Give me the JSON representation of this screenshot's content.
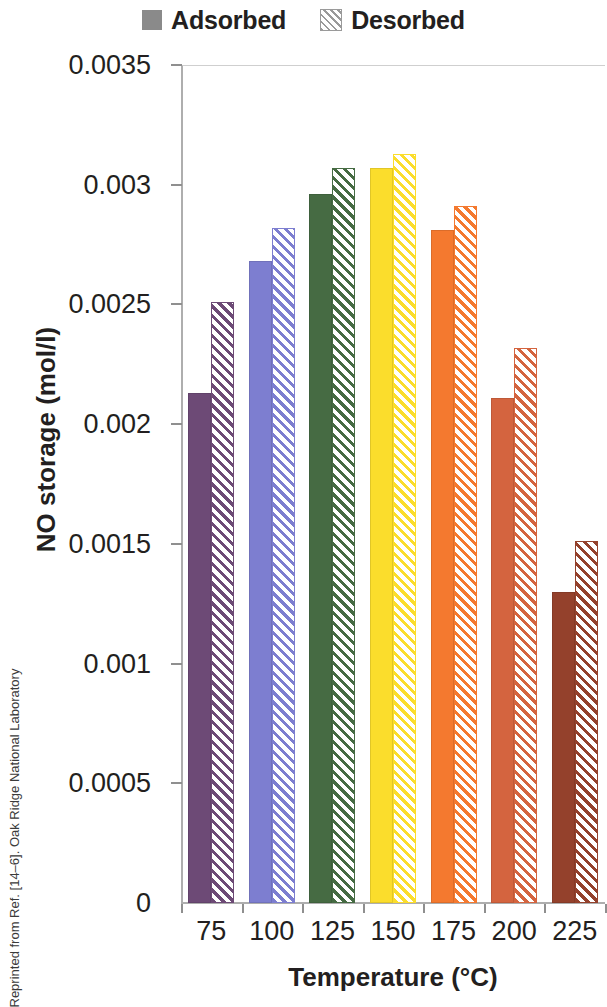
{
  "legend": {
    "entries": [
      {
        "label": "Adsorbed",
        "swatch": "solid-square-icon"
      },
      {
        "label": "Desorbed",
        "swatch": "hatched-square-icon"
      }
    ]
  },
  "axes": {
    "y_title": "NO storage (mol/l)",
    "x_title": "Temperature (°C)",
    "y_ticks": [
      "0",
      "0.0005",
      "0.001",
      "0.0015",
      "0.002",
      "0.0025",
      "0.003",
      "0.0035"
    ],
    "x_ticks": [
      "75",
      "100",
      "125",
      "150",
      "175",
      "200",
      "225"
    ]
  },
  "attribution": "Reprinted from Ref. [14–6]. Oak Ridge National Laboratory",
  "chart_data": {
    "type": "bar",
    "title": "",
    "xlabel": "Temperature (°C)",
    "ylabel": "NO storage (mol/l)",
    "categories": [
      "75",
      "100",
      "125",
      "150",
      "175",
      "200",
      "225"
    ],
    "series": [
      {
        "name": "Adsorbed",
        "pattern": "solid",
        "values": [
          0.00213,
          0.00268,
          0.00296,
          0.00307,
          0.00281,
          0.00211,
          0.0013
        ]
      },
      {
        "name": "Desorbed",
        "pattern": "hatched",
        "values": [
          0.00251,
          0.00282,
          0.00307,
          0.00313,
          0.00291,
          0.00232,
          0.00151
        ]
      }
    ],
    "colors": [
      "#6d4a76",
      "#7d7ed0",
      "#466b43",
      "#fbdd2c",
      "#f4792f",
      "#d4643f",
      "#94412c"
    ],
    "ylim": [
      0,
      0.0035
    ],
    "ytick_values": [
      0,
      0.0005,
      0.001,
      0.0015,
      0.002,
      0.0025,
      0.003,
      0.0035
    ],
    "grid": false,
    "legend_position": "top-center"
  }
}
